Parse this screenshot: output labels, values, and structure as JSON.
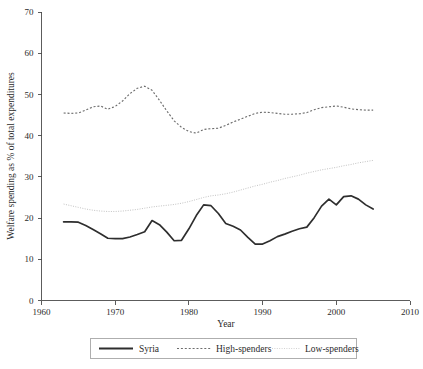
{
  "chart_data": {
    "type": "line",
    "title": "",
    "xlabel": "Year",
    "ylabel": "Welfare spending as % of total expenditures",
    "xlim": [
      1960,
      2010
    ],
    "ylim": [
      0,
      70
    ],
    "xticks": [
      1960,
      1970,
      1980,
      1990,
      2000,
      2010
    ],
    "yticks": [
      0,
      10,
      20,
      30,
      40,
      50,
      60,
      70
    ],
    "xtick_labels": [
      "1960",
      "1970",
      "1980",
      "1990",
      "2000",
      "2010"
    ],
    "ytick_labels": [
      "0",
      "10",
      "20",
      "30",
      "40",
      "50",
      "60",
      "70"
    ],
    "grid": false,
    "legend_position": "below",
    "x": [
      1963,
      1964,
      1965,
      1966,
      1967,
      1968,
      1969,
      1970,
      1971,
      1972,
      1973,
      1974,
      1975,
      1976,
      1977,
      1978,
      1979,
      1980,
      1981,
      1982,
      1983,
      1984,
      1985,
      1986,
      1987,
      1988,
      1989,
      1990,
      1991,
      1992,
      1993,
      1994,
      1995,
      1996,
      1997,
      1998,
      1999,
      2000,
      2001,
      2002,
      2003,
      2004,
      2005
    ],
    "series": [
      {
        "name": "Syria",
        "style": "solid",
        "color": "#2e2e2e",
        "values": [
          19.1,
          19.1,
          19.0,
          18.2,
          17.2,
          16.2,
          15.1,
          15.0,
          15.0,
          15.4,
          16.0,
          16.7,
          19.4,
          18.4,
          16.6,
          14.5,
          14.6,
          17.4,
          20.6,
          23.2,
          23.0,
          21.1,
          18.7,
          18.0,
          17.1,
          15.3,
          13.7,
          13.7,
          14.5,
          15.5,
          16.1,
          16.8,
          17.4,
          17.8,
          20.1,
          22.9,
          24.6,
          23.2,
          25.2,
          25.4,
          24.6,
          23.2,
          22.2
        ]
      },
      {
        "name": "High-spenders",
        "style": "dashed",
        "color": "#6d6d6d",
        "values": [
          45.5,
          45.4,
          45.5,
          46.2,
          47.0,
          47.2,
          46.4,
          47.1,
          48.4,
          50.2,
          51.5,
          52.0,
          51.0,
          48.6,
          46.0,
          43.6,
          42.0,
          41.0,
          40.6,
          41.5,
          41.7,
          41.8,
          42.5,
          43.3,
          44.0,
          44.7,
          45.4,
          45.7,
          45.6,
          45.4,
          45.2,
          45.2,
          45.3,
          45.6,
          46.3,
          46.8,
          47.0,
          47.2,
          46.9,
          46.5,
          46.3,
          46.2,
          46.2
        ]
      },
      {
        "name": "Low-spenders",
        "style": "dotted",
        "color": "#c3c3c3",
        "values": [
          23.4,
          23.0,
          22.6,
          22.2,
          21.9,
          21.7,
          21.6,
          21.6,
          21.7,
          21.9,
          22.1,
          22.4,
          22.7,
          22.9,
          23.1,
          23.3,
          23.6,
          24.0,
          24.5,
          25.0,
          25.4,
          25.6,
          25.9,
          26.3,
          26.8,
          27.3,
          27.8,
          28.2,
          28.7,
          29.1,
          29.6,
          30.0,
          30.4,
          30.9,
          31.3,
          31.7,
          32.0,
          32.3,
          32.7,
          33.0,
          33.4,
          33.7,
          34.0
        ]
      }
    ],
    "legend": [
      {
        "label": "Syria",
        "style": "solid"
      },
      {
        "label": "High-spenders",
        "style": "dashed"
      },
      {
        "label": "Low-spenders",
        "style": "dotted"
      }
    ]
  }
}
